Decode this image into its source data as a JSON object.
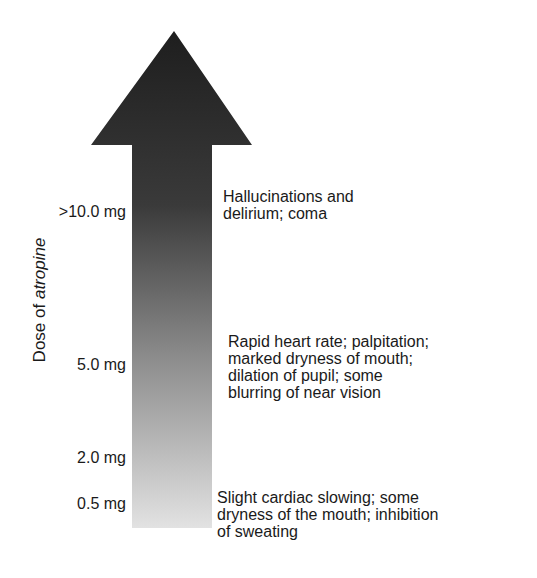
{
  "diagram": {
    "type": "dose-effect arrow",
    "axis_label_prefix": "Dose of ",
    "axis_label_drug": "atropine",
    "arrow": {
      "color_top": "#1e1e1e",
      "color_bottom": "#dcdcdc",
      "direction": "up"
    },
    "levels": [
      {
        "dose": ">10.0 mg",
        "effect_lines": [
          "Hallucinations and",
          "delirium; coma"
        ]
      },
      {
        "dose": "5.0 mg",
        "effect_lines": [
          "Rapid heart rate; palpitation;",
          "marked dryness of mouth;",
          "dilation of pupil; some",
          "blurring of near vision"
        ]
      },
      {
        "dose": "2.0 mg",
        "effect_lines": []
      },
      {
        "dose": "0.5 mg",
        "effect_lines": [
          "Slight cardiac slowing; some",
          "dryness of the mouth; inhibition",
          "of sweating"
        ]
      }
    ]
  }
}
